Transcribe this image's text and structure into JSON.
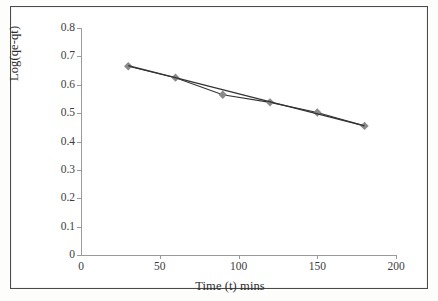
{
  "figure": {
    "background_color": "#ffffff",
    "frame_color": "#4a4a4a"
  },
  "chart_data": {
    "type": "scatter",
    "title": "",
    "xlabel": "Time (t) mins",
    "ylabel": "Log(qe-qt)",
    "xlim": [
      0,
      200
    ],
    "ylim": [
      0,
      0.8
    ],
    "grid": false,
    "legend": null,
    "x_ticks": [
      "0",
      "50",
      "100",
      "150",
      "200"
    ],
    "x_tick_values": [
      0,
      50,
      100,
      150,
      200
    ],
    "y_ticks": [
      "0",
      "0.1",
      "0.2",
      "0.3",
      "0.4",
      "0.5",
      "0.6",
      "0.7",
      "0.8"
    ],
    "y_tick_values": [
      0,
      0.1,
      0.2,
      0.3,
      0.4,
      0.5,
      0.6,
      0.7,
      0.8
    ],
    "series": [
      {
        "name": "Log(qe-qt) data",
        "marker": "diamond",
        "marker_color": "#8a8a8a",
        "line_color": "#333333",
        "x": [
          30,
          60,
          90,
          120,
          150,
          180
        ],
        "values": [
          0.665,
          0.625,
          0.565,
          0.538,
          0.502,
          0.455
        ]
      },
      {
        "name": "linear trendline",
        "marker": "none",
        "line_color": "#333333",
        "x": [
          30,
          180
        ],
        "values": [
          0.667,
          0.455
        ]
      }
    ]
  },
  "axis_colors": {
    "axis_line": "#9a9a9a",
    "tick_label": "#3d3d3d",
    "axis_title": "#2e2e2e"
  }
}
